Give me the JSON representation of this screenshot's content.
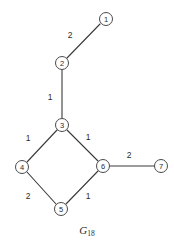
{
  "figure": {
    "caption_base": "G",
    "caption_subscript": "18",
    "background_color": "#ffffff",
    "line_color": "#3a3a3a",
    "node_fill_color": "#ffffff",
    "node_stroke_color": "#4a4a4a",
    "text_color": "#2b2b2b"
  },
  "chart_data": {
    "type": "diagram",
    "subtype": "weighted-undirected-graph",
    "title": "G18",
    "node_radius": 6.5,
    "nodes": [
      {
        "id": "1",
        "label": "1",
        "x": 106,
        "y": 19
      },
      {
        "id": "2",
        "label": "2",
        "x": 62,
        "y": 63
      },
      {
        "id": "3",
        "label": "3",
        "x": 62,
        "y": 125
      },
      {
        "id": "4",
        "label": "4",
        "x": 22,
        "y": 167
      },
      {
        "id": "5",
        "label": "5",
        "x": 61,
        "y": 209
      },
      {
        "id": "6",
        "label": "6",
        "x": 103,
        "y": 166
      },
      {
        "id": "7",
        "label": "7",
        "x": 161,
        "y": 166
      }
    ],
    "edges": [
      {
        "source": "2",
        "target": "1",
        "weight": "2",
        "x1": 67,
        "y1": 58,
        "x2": 100,
        "y2": 24,
        "lx": 70,
        "ly": 35
      },
      {
        "source": "2",
        "target": "3",
        "weight": "1",
        "x1": 62,
        "y1": 70,
        "x2": 62,
        "y2": 118,
        "lx": 50,
        "ly": 97
      },
      {
        "source": "3",
        "target": "4",
        "weight": "1",
        "x1": 57,
        "y1": 130,
        "x2": 27,
        "y2": 162,
        "lx": 28,
        "ly": 138
      },
      {
        "source": "3",
        "target": "6",
        "weight": "1",
        "x1": 67,
        "y1": 130,
        "x2": 98,
        "y2": 161,
        "lx": 88,
        "ly": 137
      },
      {
        "source": "4",
        "target": "5",
        "weight": "2",
        "x1": 27,
        "y1": 172,
        "x2": 56,
        "y2": 204,
        "lx": 28,
        "ly": 196
      },
      {
        "source": "5",
        "target": "6",
        "weight": "1",
        "x1": 66,
        "y1": 204,
        "x2": 98,
        "y2": 171,
        "lx": 88,
        "ly": 196
      },
      {
        "source": "6",
        "target": "7",
        "weight": "2",
        "x1": 110,
        "y1": 166,
        "x2": 155,
        "y2": 166,
        "lx": 129,
        "ly": 155
      }
    ],
    "axis": {
      "grid": false,
      "legend": false
    }
  }
}
